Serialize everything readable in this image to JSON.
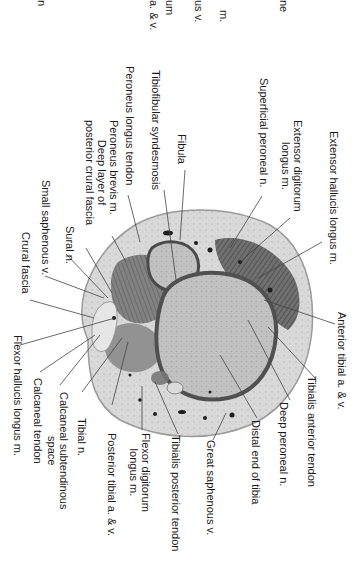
{
  "figure": {
    "orientation": "rotated 90 degrees clockwise"
  },
  "labels": {
    "extensor_hallucis_longus": "Extensor hallucis longus m.",
    "extensor_digitorum_longus": "Extensor digitorum\nlongus m.",
    "superficial_peroneal_n": "Superficial peroneal n.",
    "fibula": "Fibula",
    "tibiofibular_syndesmosis": "Tibiofibular syndesmosis",
    "peroneus_longus_tendon": "Peroneus longus tendon",
    "peroneus_brevis_m": "Peroneus brevis m.",
    "deep_layer_posterior_crural_fascia": "Deep layer of\nposterior crural fascia",
    "sural_n": "Sural n.",
    "small_saphenous_v": "Small saphenous v.",
    "crural_fascia": "Crural fascia",
    "flexor_hallucis_longus": "Flexor hallucis longus m.",
    "calcaneal_tendon": "Calcaneal tendon",
    "calcaneal_subtendinous_space": "Calcaneal subtendinous\nspace",
    "tibial_n": "Tibial n.",
    "posterior_tibial_av": "Posterior tibial a. & v.",
    "flexor_digitorum_longus": "Flexor digitorum\nlongus m.",
    "tibialis_posterior_tendon": "Tibialis posterior tendon",
    "great_saphenous_v": "Great saphenous v.",
    "distal_end_of_tibia": "Distal end of tibia",
    "deep_peroneal_n": "Deep peroneal n.",
    "tibialis_anterior_tendon": "Tibialis anterior tendon",
    "anterior_tibial_av": "Anterior tibial a. & v."
  },
  "cropped_fragments": {
    "frag_1": "ne",
    "frag_2": "m.",
    "frag_3": "us v.",
    "frag_4": "um",
    "frag_5": "a. & v.",
    "frag_6": "n"
  },
  "colors": {
    "background": "#ffffff",
    "text": "#1a1a1a",
    "leader_line": "#444444",
    "subcutaneous": "#d8d8d8",
    "muscle": "#6e6e6e",
    "bone": "#bdbdbd",
    "cortex": "#555555"
  }
}
